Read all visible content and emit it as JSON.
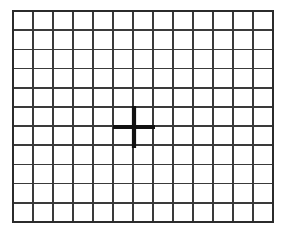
{
  "chart": {
    "type": "amsler-grid",
    "background_color": "#ffffff",
    "line_color": "#3a3a3a",
    "border_color": "#2b2b2b",
    "fixation_color": "#111111"
  },
  "grid": {
    "columns": 13,
    "rows": 11,
    "cell_width_px": 20,
    "cell_height_px": 19.2,
    "origin_x_px": 13,
    "origin_y_px": 11,
    "width_px": 260,
    "height_px": 211,
    "line_width_px": 1.55,
    "border_width_px": 1.9
  },
  "fixation_mark": {
    "name": "central-fixation-cross",
    "shape": "cross",
    "center_x_px": 134,
    "center_y_px": 127,
    "center_column_line": 6,
    "center_row_line": 6,
    "arm_half_length_px": 21,
    "arm_thickness_px": 4.2,
    "color": "#111111"
  },
  "chart_data": {
    "type": "table",
    "xlabel": "",
    "ylabel": "",
    "categories": [
      "c1",
      "c2",
      "c3",
      "c4",
      "c5",
      "c6",
      "c7",
      "c8",
      "c9",
      "c10",
      "c11",
      "c12",
      "c13"
    ],
    "values": [
      11,
      11,
      11,
      11,
      11,
      11,
      11,
      11,
      11,
      11,
      11,
      11,
      11
    ],
    "vertical_line_count": 14,
    "horizontal_line_count": 12,
    "cells_total": 143,
    "annotations": [
      "central fixation cross at grid center"
    ],
    "grid": true,
    "legend": "none"
  }
}
